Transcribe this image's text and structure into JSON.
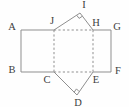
{
  "figure": {
    "colors": {
      "line": "#8f8f8f",
      "label": "#3d3d3d",
      "background": "#fefefe"
    },
    "dash_pattern": "2.2 2.2",
    "points": {
      "A": {
        "x": 21,
        "y": 30
      },
      "B": {
        "x": 21,
        "y": 72
      },
      "G": {
        "x": 111,
        "y": 30
      },
      "F": {
        "x": 111,
        "y": 72
      },
      "J": {
        "x": 54,
        "y": 30
      },
      "H": {
        "x": 93,
        "y": 30
      },
      "C": {
        "x": 54,
        "y": 72
      },
      "E": {
        "x": 93,
        "y": 72
      },
      "I": {
        "x": 80,
        "y": 13
      },
      "D": {
        "x": 77,
        "y": 95
      }
    },
    "labels": [
      {
        "text": "A",
        "x": 12,
        "y": 26
      },
      {
        "text": "B",
        "x": 12,
        "y": 69
      },
      {
        "text": "C",
        "x": 47,
        "y": 79
      },
      {
        "text": "D",
        "x": 78,
        "y": 102
      },
      {
        "text": "E",
        "x": 96,
        "y": 79
      },
      {
        "text": "F",
        "x": 118,
        "y": 70
      },
      {
        "text": "G",
        "x": 117,
        "y": 26
      },
      {
        "text": "H",
        "x": 96,
        "y": 22
      },
      {
        "text": "I",
        "x": 84,
        "y": 4
      },
      {
        "text": "J",
        "x": 52,
        "y": 20
      }
    ],
    "segments": [
      {
        "from": "A",
        "to": "J",
        "style": "solid"
      },
      {
        "from": "H",
        "to": "G",
        "style": "solid"
      },
      {
        "from": "A",
        "to": "B",
        "style": "solid"
      },
      {
        "from": "G",
        "to": "F",
        "style": "solid"
      },
      {
        "from": "B",
        "to": "C",
        "style": "solid"
      },
      {
        "from": "E",
        "to": "F",
        "style": "solid"
      },
      {
        "from": "J",
        "to": "I",
        "style": "solid"
      },
      {
        "from": "I",
        "to": "H",
        "style": "solid"
      },
      {
        "from": "C",
        "to": "D",
        "style": "solid"
      },
      {
        "from": "D",
        "to": "E",
        "style": "solid"
      },
      {
        "from": "J",
        "to": "H",
        "style": "dashed"
      },
      {
        "from": "C",
        "to": "E",
        "style": "dashed"
      },
      {
        "from": "J",
        "to": "C",
        "style": "dashed"
      },
      {
        "from": "H",
        "to": "E",
        "style": "dashed"
      }
    ],
    "right_angle_marks": [
      {
        "at": "I",
        "arm1": "J",
        "arm2": "H",
        "size": 4
      },
      {
        "at": "D",
        "arm1": "C",
        "arm2": "E",
        "size": 4
      }
    ]
  }
}
